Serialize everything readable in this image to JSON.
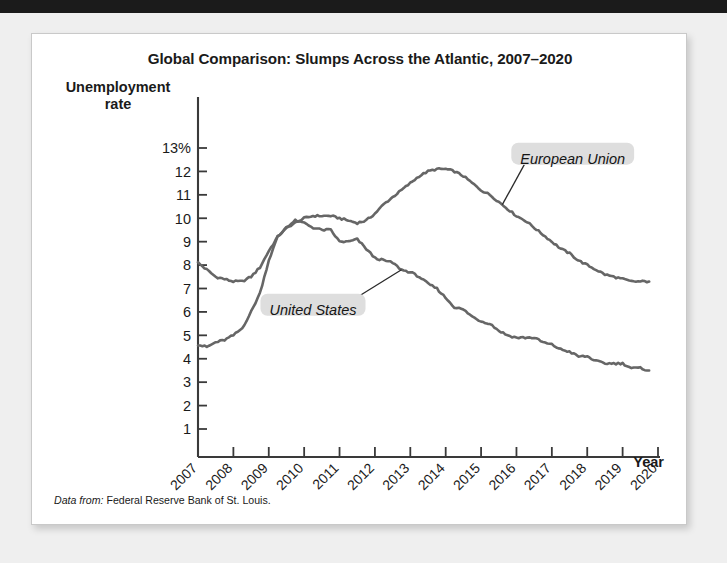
{
  "page": {
    "top_bar_color": "#1b1b1b",
    "background_color": "#efefef",
    "card_color": "#ffffff"
  },
  "figure": {
    "title": "Global Comparison: Slumps Across the Atlantic, 2007–2020",
    "y_axis_title_line1": "Unemployment",
    "y_axis_title_line2": "rate",
    "x_axis_title": "Year",
    "source_lead": "Data from:",
    "source_text": "Federal Reserve Bank of St. Louis.",
    "line_color": "#666666",
    "label_bg_color": "#dedede",
    "axis_color": "#3a3a3a"
  },
  "chart_data": {
    "type": "line",
    "title": "Global Comparison: Slumps Across the Atlantic, 2007–2020",
    "xlabel": "Year",
    "ylabel": "Unemployment rate",
    "xlim": [
      2007,
      2020
    ],
    "ylim": [
      0.6,
      13.4
    ],
    "ytick_labels": [
      "13%",
      "12",
      "11",
      "10",
      "9",
      "8",
      "7",
      "6",
      "5",
      "4",
      "3",
      "2",
      "1"
    ],
    "ytick_values": [
      13,
      12,
      11,
      10,
      9,
      8,
      7,
      6,
      5,
      4,
      3,
      2,
      1
    ],
    "xtick_labels": [
      "2007",
      "2008",
      "2009",
      "2010",
      "2011",
      "2012",
      "2013",
      "2014",
      "2015",
      "2016",
      "2017",
      "2018",
      "2019",
      "2020"
    ],
    "xtick_values": [
      2007,
      2008,
      2009,
      2010,
      2011,
      2012,
      2013,
      2014,
      2015,
      2016,
      2017,
      2018,
      2019,
      2020
    ],
    "xtick_rotation_deg": 45,
    "grid": false,
    "legend_position": "inline-annotations",
    "units": "percent",
    "series": [
      {
        "name": "European Union",
        "label_anchor_x": 2015.6,
        "label_anchor_y": 10.1,
        "x": [
          2007.0,
          2007.25,
          2007.5,
          2007.75,
          2008.0,
          2008.25,
          2008.5,
          2008.75,
          2009.0,
          2009.25,
          2009.5,
          2009.75,
          2010.0,
          2010.25,
          2010.5,
          2010.75,
          2011.0,
          2011.25,
          2011.5,
          2011.75,
          2012.0,
          2012.25,
          2012.5,
          2012.75,
          2013.0,
          2013.25,
          2013.5,
          2013.75,
          2014.0,
          2014.25,
          2014.5,
          2014.75,
          2015.0,
          2015.25,
          2015.5,
          2015.75,
          2016.0,
          2016.25,
          2016.5,
          2016.75,
          2017.0,
          2017.25,
          2017.5,
          2017.75,
          2018.0,
          2018.25,
          2018.5,
          2018.75,
          2019.0,
          2019.25,
          2019.5,
          2019.75
        ],
        "y": [
          8.1,
          7.8,
          7.5,
          7.4,
          7.3,
          7.3,
          7.5,
          7.9,
          8.6,
          9.2,
          9.6,
          9.8,
          10.0,
          10.1,
          10.1,
          10.1,
          10.0,
          9.9,
          9.8,
          9.9,
          10.2,
          10.6,
          10.9,
          11.2,
          11.5,
          11.8,
          12.0,
          12.1,
          12.1,
          12.0,
          11.8,
          11.5,
          11.2,
          11.0,
          10.7,
          10.4,
          10.1,
          9.9,
          9.6,
          9.3,
          9.0,
          8.7,
          8.5,
          8.2,
          8.0,
          7.8,
          7.6,
          7.5,
          7.4,
          7.3,
          7.3,
          7.3
        ]
      },
      {
        "name": "United States",
        "label_anchor_x": 2012.75,
        "label_anchor_y": 4.1,
        "x": [
          2007.0,
          2007.25,
          2007.5,
          2007.75,
          2008.0,
          2008.25,
          2008.5,
          2008.75,
          2009.0,
          2009.25,
          2009.5,
          2009.75,
          2010.0,
          2010.25,
          2010.5,
          2010.75,
          2011.0,
          2011.25,
          2011.5,
          2011.75,
          2012.0,
          2012.25,
          2012.5,
          2012.75,
          2013.0,
          2013.25,
          2013.5,
          2013.75,
          2014.0,
          2014.25,
          2014.5,
          2014.75,
          2015.0,
          2015.25,
          2015.5,
          2015.75,
          2016.0,
          2016.25,
          2016.5,
          2016.75,
          2017.0,
          2017.25,
          2017.5,
          2017.75,
          2018.0,
          2018.25,
          2018.5,
          2018.75,
          2019.0,
          2019.25,
          2019.5,
          2019.75
        ],
        "y": [
          4.6,
          4.5,
          4.7,
          4.8,
          5.0,
          5.3,
          6.0,
          6.8,
          8.2,
          9.2,
          9.6,
          9.9,
          9.8,
          9.6,
          9.5,
          9.5,
          9.0,
          9.0,
          9.1,
          8.7,
          8.3,
          8.2,
          8.1,
          7.8,
          7.7,
          7.5,
          7.2,
          7.0,
          6.6,
          6.2,
          6.1,
          5.8,
          5.6,
          5.5,
          5.2,
          5.0,
          4.9,
          4.9,
          4.9,
          4.7,
          4.6,
          4.4,
          4.3,
          4.1,
          4.1,
          3.9,
          3.8,
          3.8,
          3.8,
          3.6,
          3.6,
          3.5
        ]
      }
    ]
  }
}
